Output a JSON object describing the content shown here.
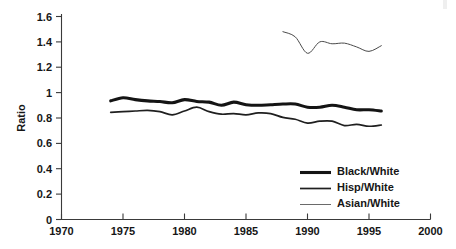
{
  "chart_data": {
    "type": "line",
    "title": "",
    "xlabel": "",
    "ylabel": "Ratio",
    "xlim": [
      1970,
      2000
    ],
    "ylim": [
      0,
      1.6
    ],
    "grid": false,
    "legend_position": "bottom-right",
    "x_ticks": [
      "1970",
      "1975",
      "1980",
      "1985",
      "1990",
      "1995",
      "2000"
    ],
    "y_ticks": [
      "0",
      "0.2",
      "0.4",
      "0.6",
      "0.8",
      "1",
      "1.2",
      "1.4",
      "1.6"
    ],
    "series": [
      {
        "name": "Black/White",
        "line_weight": "thick",
        "color": "#141414",
        "x": [
          1974,
          1975,
          1976,
          1977,
          1978,
          1979,
          1980,
          1981,
          1982,
          1983,
          1984,
          1985,
          1986,
          1987,
          1988,
          1989,
          1990,
          1991,
          1992,
          1993,
          1994,
          1995,
          1996
        ],
        "values": [
          0.935,
          0.96,
          0.945,
          0.935,
          0.93,
          0.92,
          0.945,
          0.93,
          0.925,
          0.9,
          0.925,
          0.905,
          0.9,
          0.905,
          0.91,
          0.91,
          0.885,
          0.885,
          0.9,
          0.885,
          0.865,
          0.865,
          0.855
        ]
      },
      {
        "name": "Hisp/White",
        "line_weight": "medium",
        "color": "#1f1f1f",
        "x": [
          1974,
          1975,
          1976,
          1977,
          1978,
          1979,
          1980,
          1981,
          1982,
          1983,
          1984,
          1985,
          1986,
          1987,
          1988,
          1989,
          1990,
          1991,
          1992,
          1993,
          1994,
          1995,
          1996
        ],
        "values": [
          0.845,
          0.85,
          0.855,
          0.86,
          0.85,
          0.825,
          0.855,
          0.885,
          0.85,
          0.83,
          0.835,
          0.825,
          0.84,
          0.835,
          0.805,
          0.79,
          0.76,
          0.775,
          0.775,
          0.74,
          0.75,
          0.735,
          0.745
        ]
      },
      {
        "name": "Asian/White",
        "line_weight": "thin",
        "color": "#4a4a4a",
        "x": [
          1988,
          1989,
          1990,
          1991,
          1992,
          1993,
          1994,
          1995,
          1996
        ],
        "values": [
          1.48,
          1.44,
          1.31,
          1.4,
          1.385,
          1.39,
          1.36,
          1.325,
          1.37
        ]
      }
    ]
  },
  "legend": {
    "items": [
      {
        "label": "Black/White"
      },
      {
        "label": "Hisp/White"
      },
      {
        "label": "Asian/White"
      }
    ]
  }
}
